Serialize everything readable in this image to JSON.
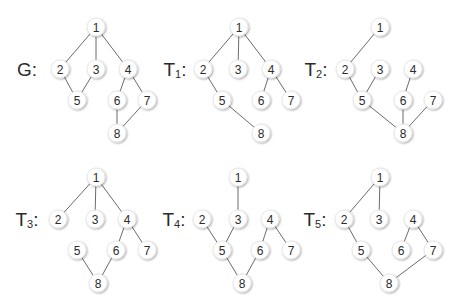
{
  "diagram": {
    "title": "",
    "node_radius": 9,
    "colors": {
      "background": "#ffffff",
      "edge": "#6b6b6b",
      "node_fill": "#ffffff",
      "node_stroke": "#e6e6e6",
      "text": "#2b2b2b"
    },
    "graphs": [
      {
        "id": "G",
        "label": "G",
        "subscript": "",
        "label_pos": [
          27,
          69
        ],
        "nodes": [
          {
            "id": "1",
            "x": 96,
            "y": 27
          },
          {
            "id": "2",
            "x": 60,
            "y": 69
          },
          {
            "id": "3",
            "x": 96,
            "y": 69
          },
          {
            "id": "4",
            "x": 128,
            "y": 69
          },
          {
            "id": "5",
            "x": 77,
            "y": 100
          },
          {
            "id": "6",
            "x": 117,
            "y": 100
          },
          {
            "id": "7",
            "x": 147,
            "y": 100
          },
          {
            "id": "8",
            "x": 117,
            "y": 133
          }
        ],
        "edges": [
          [
            "1",
            "2"
          ],
          [
            "1",
            "3"
          ],
          [
            "1",
            "4"
          ],
          [
            "2",
            "5"
          ],
          [
            "3",
            "5"
          ],
          [
            "4",
            "6"
          ],
          [
            "4",
            "7"
          ],
          [
            "6",
            "8"
          ],
          [
            "7",
            "8"
          ]
        ]
      },
      {
        "id": "T1",
        "label": "T",
        "subscript": "1",
        "label_pos": [
          175,
          69
        ],
        "nodes": [
          {
            "id": "1",
            "x": 239,
            "y": 27
          },
          {
            "id": "2",
            "x": 203,
            "y": 69
          },
          {
            "id": "3",
            "x": 238,
            "y": 69
          },
          {
            "id": "4",
            "x": 271,
            "y": 69
          },
          {
            "id": "5",
            "x": 222,
            "y": 100
          },
          {
            "id": "6",
            "x": 261,
            "y": 100
          },
          {
            "id": "7",
            "x": 291,
            "y": 100
          },
          {
            "id": "8",
            "x": 261,
            "y": 133
          }
        ],
        "edges": [
          [
            "1",
            "2"
          ],
          [
            "1",
            "3"
          ],
          [
            "1",
            "4"
          ],
          [
            "2",
            "5"
          ],
          [
            "5",
            "8"
          ],
          [
            "4",
            "6"
          ],
          [
            "4",
            "7"
          ]
        ]
      },
      {
        "id": "T2",
        "label": "T",
        "subscript": "2",
        "label_pos": [
          316,
          69
        ],
        "nodes": [
          {
            "id": "1",
            "x": 380,
            "y": 27
          },
          {
            "id": "2",
            "x": 345,
            "y": 69
          },
          {
            "id": "3",
            "x": 380,
            "y": 69
          },
          {
            "id": "4",
            "x": 413,
            "y": 69
          },
          {
            "id": "5",
            "x": 362,
            "y": 100
          },
          {
            "id": "6",
            "x": 403,
            "y": 100
          },
          {
            "id": "7",
            "x": 433,
            "y": 100
          },
          {
            "id": "8",
            "x": 403,
            "y": 133
          }
        ],
        "edges": [
          [
            "1",
            "2"
          ],
          [
            "2",
            "5"
          ],
          [
            "3",
            "5"
          ],
          [
            "5",
            "8"
          ],
          [
            "4",
            "6"
          ],
          [
            "6",
            "8"
          ],
          [
            "7",
            "8"
          ]
        ]
      },
      {
        "id": "T3",
        "label": "T",
        "subscript": "3",
        "label_pos": [
          27,
          219
        ],
        "nodes": [
          {
            "id": "1",
            "x": 96,
            "y": 177
          },
          {
            "id": "2",
            "x": 58,
            "y": 219
          },
          {
            "id": "3",
            "x": 95,
            "y": 219
          },
          {
            "id": "4",
            "x": 127,
            "y": 219
          },
          {
            "id": "5",
            "x": 77,
            "y": 250
          },
          {
            "id": "6",
            "x": 116,
            "y": 250
          },
          {
            "id": "7",
            "x": 147,
            "y": 250
          },
          {
            "id": "8",
            "x": 98,
            "y": 283
          }
        ],
        "edges": [
          [
            "1",
            "2"
          ],
          [
            "1",
            "3"
          ],
          [
            "1",
            "4"
          ],
          [
            "4",
            "6"
          ],
          [
            "4",
            "7"
          ],
          [
            "5",
            "8"
          ],
          [
            "6",
            "8"
          ]
        ]
      },
      {
        "id": "T4",
        "label": "T",
        "subscript": "4",
        "label_pos": [
          174,
          219
        ],
        "nodes": [
          {
            "id": "1",
            "x": 238,
            "y": 177
          },
          {
            "id": "2",
            "x": 202,
            "y": 219
          },
          {
            "id": "3",
            "x": 238,
            "y": 219
          },
          {
            "id": "4",
            "x": 270,
            "y": 219
          },
          {
            "id": "5",
            "x": 222,
            "y": 250
          },
          {
            "id": "6",
            "x": 260,
            "y": 250
          },
          {
            "id": "7",
            "x": 291,
            "y": 250
          },
          {
            "id": "8",
            "x": 242,
            "y": 283
          }
        ],
        "edges": [
          [
            "1",
            "3"
          ],
          [
            "2",
            "5"
          ],
          [
            "3",
            "5"
          ],
          [
            "5",
            "8"
          ],
          [
            "6",
            "8"
          ],
          [
            "4",
            "6"
          ],
          [
            "4",
            "7"
          ]
        ]
      },
      {
        "id": "T5",
        "label": "T",
        "subscript": "5",
        "label_pos": [
          315,
          219
        ],
        "nodes": [
          {
            "id": "1",
            "x": 380,
            "y": 177
          },
          {
            "id": "2",
            "x": 344,
            "y": 219
          },
          {
            "id": "3",
            "x": 379,
            "y": 219
          },
          {
            "id": "4",
            "x": 413,
            "y": 219
          },
          {
            "id": "5",
            "x": 361,
            "y": 250
          },
          {
            "id": "6",
            "x": 401,
            "y": 250
          },
          {
            "id": "7",
            "x": 433,
            "y": 250
          },
          {
            "id": "8",
            "x": 389,
            "y": 283
          }
        ],
        "edges": [
          [
            "1",
            "2"
          ],
          [
            "1",
            "3"
          ],
          [
            "2",
            "5"
          ],
          [
            "5",
            "8"
          ],
          [
            "7",
            "8"
          ],
          [
            "4",
            "6"
          ],
          [
            "4",
            "7"
          ]
        ]
      }
    ]
  }
}
